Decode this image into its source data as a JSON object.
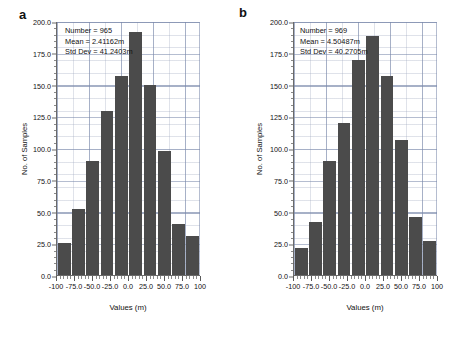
{
  "figure": {
    "panels": [
      {
        "letter": "a",
        "stats": {
          "number": "Number = 965",
          "mean": "Mean = 2.41162m",
          "std_dev": "Std Dev = 41.2403m"
        },
        "xlabel": "Values (m)",
        "ylabel": "No. of Samples"
      },
      {
        "letter": "b",
        "stats": {
          "number": "Number = 969",
          "mean": "Mean = 4.50487m",
          "std_dev": "Std Dev = 40.2705m"
        },
        "xlabel": "Values (m)",
        "ylabel": "No. of Samples"
      }
    ]
  },
  "axes": {
    "y_ticks": [
      "0.0",
      "25.0",
      "50.0",
      "75.0",
      "100.0",
      "125.0",
      "150.0",
      "175.0",
      "200.0"
    ],
    "x_ticks": [
      "-100",
      "-75.0",
      "-50.0",
      "-25.0",
      "0.0",
      "25.0",
      "50.0",
      "75.0",
      "100"
    ],
    "ylim": [
      0,
      200
    ],
    "xlim": [
      -100,
      100
    ]
  },
  "colors": {
    "bar": "#4b4b4b",
    "grid": "#96a0b9",
    "axis": "#6a6a6a",
    "text": "#111111",
    "background": "#ffffff"
  },
  "chart_data": [
    {
      "type": "bar",
      "title": "a",
      "xlabel": "Values (m)",
      "ylabel": "No. of Samples",
      "xlim": [
        -100,
        100
      ],
      "ylim": [
        0,
        200
      ],
      "grid": true,
      "legend": "none",
      "annotations": [
        "Number = 965",
        "Mean = 2.41162m",
        "Std Dev = 41.2403m"
      ],
      "categories": [
        "-100 to -80",
        "-80 to -60",
        "-60 to -40",
        "-40 to -20",
        "-20 to 0",
        "0 to 20",
        "20 to 40",
        "40 to 60",
        "60 to 80",
        "80 to 100"
      ],
      "bin_centers": [
        -90,
        -70,
        -50,
        -30,
        -10,
        10,
        30,
        50,
        70,
        90
      ],
      "values": [
        25,
        52,
        90,
        130,
        157,
        192,
        150,
        98,
        40,
        31
      ],
      "summary": {
        "count": 965,
        "mean_m": 2.41162,
        "std_dev_m": 41.2403
      }
    },
    {
      "type": "bar",
      "title": "b",
      "xlabel": "Values (m)",
      "ylabel": "No. of Samples",
      "xlim": [
        -100,
        100
      ],
      "ylim": [
        0,
        200
      ],
      "grid": true,
      "legend": "none",
      "annotations": [
        "Number = 969",
        "Mean = 4.50487m",
        "Std Dev = 40.2705m"
      ],
      "categories": [
        "-100 to -80",
        "-80 to -60",
        "-60 to -40",
        "-40 to -20",
        "-20 to 0",
        "0 to 20",
        "20 to 40",
        "40 to 60",
        "60 to 80",
        "80 to 100"
      ],
      "bin_centers": [
        -90,
        -70,
        -50,
        -30,
        -10,
        10,
        30,
        50,
        70,
        90
      ],
      "values": [
        21,
        42,
        90,
        120,
        170,
        189,
        157,
        107,
        46,
        27
      ],
      "summary": {
        "count": 969,
        "mean_m": 4.50487,
        "std_dev_m": 40.2705
      }
    }
  ]
}
